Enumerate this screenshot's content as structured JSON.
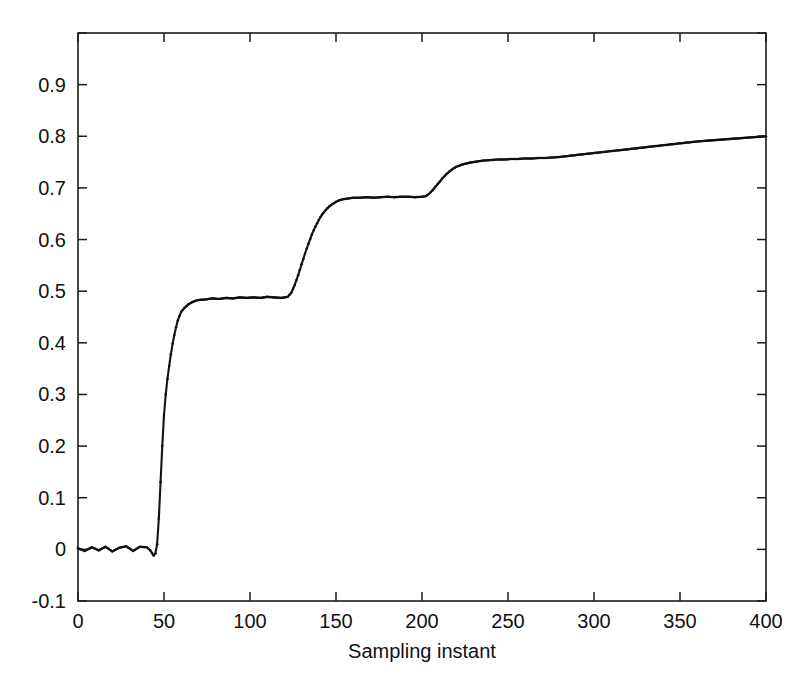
{
  "figure": {
    "background_color": "#ffffff",
    "line_color": "#141414",
    "axis_color": "#1b1b1b",
    "title": "",
    "xlabel": "Sampling instant",
    "ylabel": ""
  },
  "chart_data": {
    "type": "line",
    "title": "",
    "xlabel": "Sampling instant",
    "ylabel": "",
    "xlim": [
      0,
      400
    ],
    "ylim": [
      -0.1,
      1.0
    ],
    "grid": false,
    "legend": null,
    "x_ticks": [
      0,
      50,
      100,
      150,
      200,
      250,
      300,
      350,
      400
    ],
    "x_tick_labels": [
      "0",
      "50",
      "100",
      "150",
      "200",
      "250",
      "300",
      "350",
      "400"
    ],
    "y_ticks": [
      -0.1,
      0,
      0.1,
      0.2,
      0.3,
      0.4,
      0.5,
      0.6,
      0.7,
      0.8,
      0.9,
      1.0
    ],
    "y_tick_labels": [
      "-0.1",
      "0",
      "0.1",
      "0.2",
      "0.3",
      "0.4",
      "0.5",
      "0.6",
      "0.7",
      "0.8",
      "0.9",
      ""
    ],
    "marker": "dot",
    "series": [
      {
        "name": "response",
        "x": [
          0,
          4,
          8,
          12,
          16,
          20,
          24,
          28,
          32,
          36,
          40,
          42,
          44,
          45,
          46,
          47,
          48,
          49,
          50,
          51,
          52,
          53,
          54,
          55,
          56,
          57,
          58,
          59,
          60,
          62,
          64,
          66,
          68,
          70,
          74,
          78,
          82,
          86,
          90,
          94,
          98,
          102,
          106,
          110,
          114,
          118,
          120,
          122,
          124,
          126,
          128,
          130,
          132,
          134,
          136,
          138,
          140,
          142,
          144,
          146,
          148,
          150,
          152,
          154,
          156,
          158,
          160,
          164,
          168,
          172,
          176,
          180,
          184,
          188,
          192,
          196,
          200,
          202,
          204,
          206,
          208,
          210,
          212,
          214,
          216,
          218,
          220,
          224,
          228,
          232,
          236,
          240,
          244,
          248,
          252,
          256,
          260,
          264,
          268,
          272,
          276,
          280,
          288,
          296,
          304,
          312,
          320,
          328,
          336,
          344,
          352,
          360,
          368,
          376,
          384,
          392,
          400
        ],
        "y": [
          0.002,
          -0.003,
          0.004,
          -0.002,
          0.005,
          -0.004,
          0.003,
          0.006,
          -0.003,
          0.005,
          0.004,
          -0.002,
          -0.012,
          -0.008,
          0.01,
          0.06,
          0.13,
          0.2,
          0.26,
          0.3,
          0.33,
          0.355,
          0.378,
          0.398,
          0.415,
          0.43,
          0.443,
          0.452,
          0.46,
          0.468,
          0.474,
          0.478,
          0.481,
          0.483,
          0.484,
          0.486,
          0.485,
          0.487,
          0.486,
          0.488,
          0.487,
          0.488,
          0.487,
          0.489,
          0.488,
          0.487,
          0.488,
          0.489,
          0.497,
          0.512,
          0.531,
          0.552,
          0.573,
          0.592,
          0.61,
          0.625,
          0.638,
          0.649,
          0.657,
          0.664,
          0.669,
          0.673,
          0.676,
          0.678,
          0.679,
          0.68,
          0.681,
          0.681,
          0.682,
          0.681,
          0.682,
          0.683,
          0.682,
          0.683,
          0.683,
          0.682,
          0.683,
          0.684,
          0.688,
          0.695,
          0.703,
          0.711,
          0.719,
          0.726,
          0.732,
          0.737,
          0.741,
          0.746,
          0.749,
          0.751,
          0.753,
          0.754,
          0.755,
          0.755,
          0.756,
          0.756,
          0.757,
          0.757,
          0.758,
          0.758,
          0.759,
          0.76,
          0.763,
          0.766,
          0.769,
          0.772,
          0.775,
          0.778,
          0.781,
          0.784,
          0.787,
          0.79,
          0.792,
          0.794,
          0.796,
          0.798,
          0.8
        ]
      }
    ],
    "plateaus": [
      {
        "label": "baseline",
        "x_range": [
          0,
          44
        ],
        "value": 0.0
      },
      {
        "label": "first-step",
        "x_range": [
          60,
          122
        ],
        "value": 0.487
      },
      {
        "label": "second-step",
        "x_range": [
          150,
          202
        ],
        "value": 0.682
      },
      {
        "label": "third-step",
        "x_range": [
          240,
          280
        ],
        "value": 0.756
      },
      {
        "label": "final",
        "x_range": [
          400,
          400
        ],
        "value": 0.8
      }
    ]
  }
}
